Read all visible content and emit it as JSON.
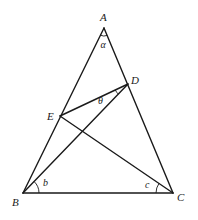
{
  "diagram": {
    "type": "triangle-geometry",
    "points": {
      "A": {
        "label": "A",
        "x": 104,
        "y": 28
      },
      "B": {
        "label": "B",
        "x": 23,
        "y": 193
      },
      "C": {
        "label": "C",
        "x": 173,
        "y": 193
      },
      "D": {
        "label": "D",
        "x": 128,
        "y": 84
      },
      "E": {
        "label": "E",
        "x": 60,
        "y": 116
      }
    },
    "segments": [
      "AB",
      "AC",
      "BC",
      "BD",
      "CE",
      "DE"
    ],
    "angles": {
      "alpha": {
        "label": "α",
        "vertex": "A"
      },
      "b": {
        "label": "b",
        "vertex": "B"
      },
      "c": {
        "label": "c",
        "vertex": "C"
      },
      "theta": {
        "label": "θ",
        "vertex": "D"
      }
    },
    "colors": {
      "stroke": "#1a1a1a",
      "background": "#ffffff"
    }
  }
}
